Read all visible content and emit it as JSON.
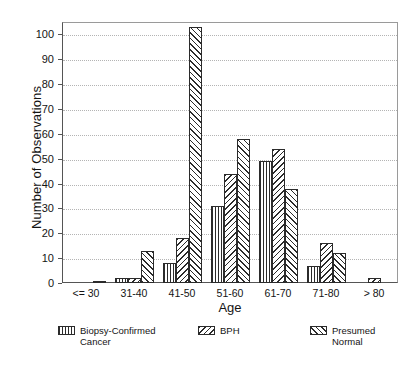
{
  "chart_data": {
    "type": "bar",
    "title": "",
    "xlabel": "Age",
    "ylabel": "Number of Observations",
    "categories": [
      "<= 30",
      "31-40",
      "41-50",
      "51-60",
      "61-70",
      "71-80",
      "> 80"
    ],
    "series": [
      {
        "name": "Biopsy-Confirmed Cancer",
        "pattern": "vertical-lines",
        "values": [
          0,
          2,
          8,
          31,
          49,
          7,
          0
        ]
      },
      {
        "name": "BPH",
        "pattern": "backslash-hatch",
        "values": [
          0,
          2,
          18,
          44,
          54,
          16,
          2
        ]
      },
      {
        "name": "Presumed Normal",
        "pattern": "forwardslash-hatch",
        "values": [
          1,
          13,
          103,
          58,
          38,
          12,
          0
        ]
      }
    ],
    "ylim": [
      0,
      105
    ],
    "y_ticks": [
      0,
      10,
      20,
      30,
      40,
      50,
      60,
      70,
      80,
      90,
      100
    ],
    "grid": true,
    "legend_position": "bottom"
  },
  "legend": {
    "entries": [
      {
        "label": "Biopsy-Confirmed\nCancer"
      },
      {
        "label": "BPH"
      },
      {
        "label": "Presumed\nNormal"
      }
    ]
  }
}
